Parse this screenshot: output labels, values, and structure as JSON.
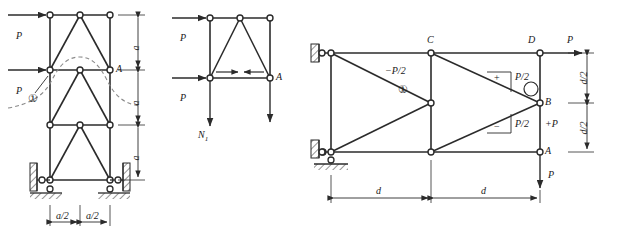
{
  "figure": {
    "stroke_color": "#2b2b2b",
    "node_fill": "#ffffff",
    "dash_color": "#777777"
  },
  "figure_left": {
    "name": "three-panel-vertical-truss",
    "force_top_label": "P",
    "force_mid_label": "P",
    "joint_label_A": "A",
    "member_marker": "①",
    "dim_vertical": [
      "a",
      "a",
      "a"
    ],
    "dim_horizontal": [
      "a/2",
      "a/2"
    ],
    "influence_line": "dashed-influence-curve",
    "support_left": "roller-support",
    "support_right": "roller-support"
  },
  "figure_middle": {
    "name": "free-body-diagram-section",
    "force_top_label": "P",
    "force_mid_label": "P",
    "joint_label_A": "A",
    "axial_force_label": "N",
    "axial_force_sub": "1",
    "member_arrows": "compression-pair-arrows"
  },
  "figure_right": {
    "name": "cantilever-truss-force-diagram",
    "joint_label_C": "C",
    "joint_label_D": "D",
    "joint_label_A": "A",
    "joint_label_B": "B",
    "force_top_right": "P",
    "force_bottom_right": "P",
    "member_marker": "①",
    "force_label_negative": "−P/2",
    "force_label_upper": "P/2",
    "force_label_lower": "P/2",
    "force_label_axial": "+P",
    "sign_plus": "+",
    "sign_minus": "−",
    "dim_horizontal": [
      "d",
      "d"
    ],
    "dim_vertical": [
      "d/2",
      "d/2"
    ],
    "support_top": "pin-support-wall",
    "support_bottom": "roller-support-wall"
  }
}
